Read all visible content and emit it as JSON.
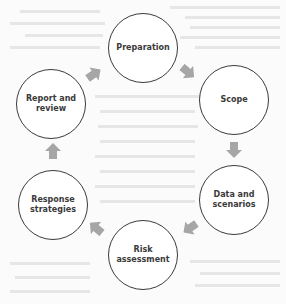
{
  "diagram": {
    "type": "cycle",
    "colors": {
      "background": "#fbfbfb",
      "circle_border": "#3a3a3a",
      "label": "#3a3a3a",
      "arrow": "#a6a6a6"
    },
    "nodes": [
      {
        "id": "preparation",
        "label": "Preparation"
      },
      {
        "id": "scope",
        "label": "Scope"
      },
      {
        "id": "data-and-scenarios",
        "label": "Data and\nscenarios"
      },
      {
        "id": "risk-assessment",
        "label": "Risk\nassessment"
      },
      {
        "id": "response-strategies",
        "label": "Response\nstrategies"
      },
      {
        "id": "report-and-review",
        "label": "Report and\nreview"
      }
    ],
    "edges": [
      {
        "from": "preparation",
        "to": "scope",
        "direction": "down-right"
      },
      {
        "from": "scope",
        "to": "data-and-scenarios",
        "direction": "down"
      },
      {
        "from": "data-and-scenarios",
        "to": "risk-assessment",
        "direction": "down-left"
      },
      {
        "from": "risk-assessment",
        "to": "response-strategies",
        "direction": "up-left"
      },
      {
        "from": "response-strategies",
        "to": "report-and-review",
        "direction": "up"
      },
      {
        "from": "report-and-review",
        "to": "preparation",
        "direction": "up-right"
      }
    ]
  }
}
